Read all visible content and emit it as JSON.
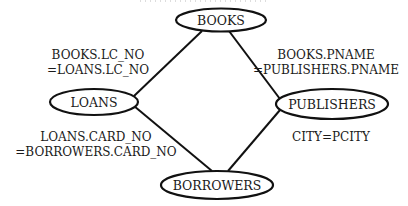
{
  "diagram": {
    "type": "query-join-graph",
    "nodes": [
      {
        "id": "books",
        "label": "BOOKS"
      },
      {
        "id": "loans",
        "label": "LOANS"
      },
      {
        "id": "publishers",
        "label": "PUBLISHERS"
      },
      {
        "id": "borrowers",
        "label": "BORROWERS"
      }
    ],
    "edges": [
      {
        "from": "books",
        "to": "loans",
        "label_line1": "BOOKS.LC_NO",
        "label_line2": "=LOANS.LC_NO"
      },
      {
        "from": "books",
        "to": "publishers",
        "label_line1": "BOOKS.PNAME",
        "label_line2": "=PUBLISHERS.PNAME"
      },
      {
        "from": "loans",
        "to": "borrowers",
        "label_line1": "LOANS.CARD_NO",
        "label_line2": "=BORROWERS.CARD_NO"
      },
      {
        "from": "publishers",
        "to": "borrowers",
        "label_line1": "CITY=PCITY"
      }
    ],
    "colors": {
      "stroke": "#111111",
      "text": "#1a1a1a",
      "background": "#ffffff"
    }
  }
}
